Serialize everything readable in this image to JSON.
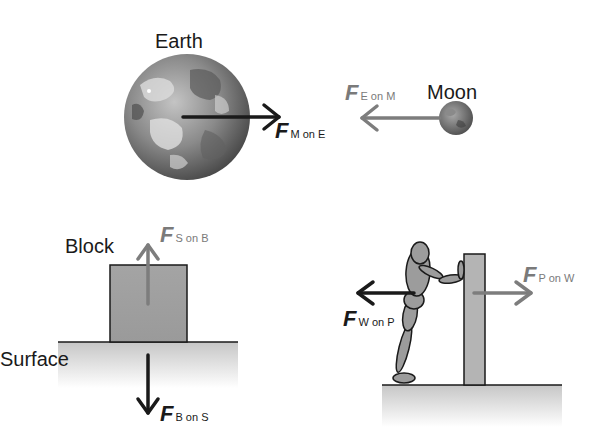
{
  "colors": {
    "dark_arrow": "#1a1a1a",
    "grey_arrow": "#7d7d7d",
    "block_fill": "#a0a0a0",
    "surface_top": "#c8c8c8",
    "background": "#ffffff"
  },
  "earth_moon": {
    "earth_label": "Earth",
    "moon_label": "Moon",
    "force_moon_on_earth": {
      "symbol": "F",
      "subscript": "M on E"
    },
    "force_earth_on_moon": {
      "symbol": "F",
      "subscript": "E on M"
    }
  },
  "block_surface": {
    "block_label": "Block",
    "surface_label": "Surface",
    "force_surface_on_block": {
      "symbol": "F",
      "subscript": "S on B"
    },
    "force_block_on_surface": {
      "symbol": "F",
      "subscript": "B on S"
    }
  },
  "person_wall": {
    "force_wall_on_person": {
      "symbol": "F",
      "subscript": "W on P"
    },
    "force_person_on_wall": {
      "symbol": "F",
      "subscript": "P on W"
    }
  }
}
